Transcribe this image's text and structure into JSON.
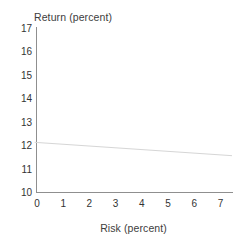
{
  "chart_data": {
    "type": "line",
    "title": "",
    "xlabel": "Risk (percent)",
    "ylabel": "Return (percent)",
    "xlim": [
      0,
      7
    ],
    "ylim": [
      10,
      17
    ],
    "xticks": [
      "0",
      "1",
      "2",
      "3",
      "4",
      "5",
      "6",
      "7"
    ],
    "yticks": [
      "17",
      "16",
      "15",
      "14",
      "13",
      "12",
      "11",
      "10"
    ],
    "grid": false,
    "legend": null,
    "series": [
      {
        "name": "risk-return-line",
        "color": "#d6d6d6",
        "x": [
          -0.05,
          7.5
        ],
        "y": [
          12.12,
          11.55
        ],
        "points": [
          {
            "x": 0,
            "y": 12.11
          },
          {
            "x": 1,
            "y": 12.03
          },
          {
            "x": 2,
            "y": 11.96
          },
          {
            "x": 3,
            "y": 11.88
          },
          {
            "x": 4,
            "y": 11.81
          },
          {
            "x": 5,
            "y": 11.73
          },
          {
            "x": 6,
            "y": 11.66
          },
          {
            "x": 7,
            "y": 11.58
          }
        ]
      }
    ]
  },
  "style": {
    "axis_color": "#8f8f8f",
    "text_color": "#333333",
    "line_color": "#d6d6d6",
    "background": "#ffffff"
  }
}
